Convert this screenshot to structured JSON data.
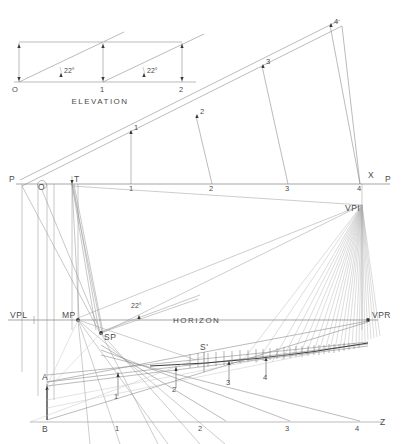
{
  "figure": {
    "type": "technical-drawing",
    "background_color": "#ffffff",
    "line_color": "#8a8a8a",
    "heavy_line_color": "#3a3a3a",
    "text_color": "#4a4a4a"
  },
  "elevation": {
    "title": "ELEVATION",
    "baseline_ticks": [
      "O",
      "1",
      "2"
    ],
    "angle_labels": [
      "22°",
      "22°"
    ],
    "angle_value": "22°"
  },
  "inclined_plane": {
    "ticks": [
      "1",
      "2",
      "3",
      "4"
    ]
  },
  "picture_plane": {
    "left_label": "P",
    "right_label": "P",
    "corner_label": "X",
    "origin_label": "O",
    "station_label": "T",
    "ticks": [
      "1",
      "2",
      "3",
      "4"
    ]
  },
  "horizon": {
    "label": "HORIZON",
    "vanishing_point_left": "VPL",
    "vanishing_point_right": "VPR",
    "vanishing_point_inclined": "VPI",
    "measuring_point": "MP",
    "station_point": "SP",
    "angle_label": "22°"
  },
  "ground": {
    "vertical_top_label": "A",
    "vertical_bottom_label": "B",
    "station_prime_label": "S'",
    "right_label": "Z",
    "ground_ticks": [
      "1",
      "2",
      "3",
      "4"
    ],
    "perspective_ticks": [
      "1",
      "2",
      "3",
      "4"
    ]
  }
}
